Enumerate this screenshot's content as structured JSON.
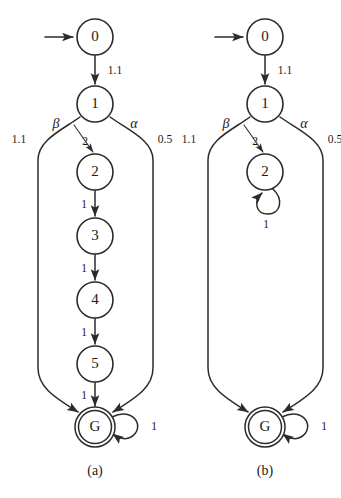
{
  "figure": {
    "background_color": "#ffffff",
    "ink_color": "#2b2b2b"
  },
  "panels": [
    {
      "id": "panel-a",
      "caption": "(a)",
      "start_marker": "start-arrow",
      "nodes": [
        {
          "id": "n0",
          "label": "0",
          "type": "normal",
          "cx": 95,
          "cy": 37,
          "r": 18
        },
        {
          "id": "n1",
          "label": "1",
          "type": "normal",
          "cx": 95,
          "cy": 104,
          "r": 18
        },
        {
          "id": "n2",
          "label": "2",
          "type": "normal",
          "cx": 95,
          "cy": 172,
          "r": 18
        },
        {
          "id": "n3",
          "label": "3",
          "type": "normal",
          "cx": 95,
          "cy": 236,
          "r": 18
        },
        {
          "id": "n4",
          "label": "4",
          "type": "normal",
          "cx": 95,
          "cy": 300,
          "r": 18
        },
        {
          "id": "n5",
          "label": "5",
          "type": "normal",
          "cx": 95,
          "cy": 364,
          "r": 18
        },
        {
          "id": "nG",
          "label": "G",
          "type": "accepting",
          "cx": 95,
          "cy": 427,
          "r": 19
        }
      ],
      "edges": [
        {
          "id": "e-start",
          "from": "start",
          "to": "n0",
          "weight": ""
        },
        {
          "id": "e-0-1",
          "from": "n0",
          "to": "n1",
          "weight": "1.1"
        },
        {
          "id": "e-1-2",
          "from": "n1",
          "to": "n2",
          "weight": "2",
          "action": "β"
        },
        {
          "id": "e-1-G-left",
          "from": "n1",
          "to": "nG",
          "weight": "1.1",
          "action": "β"
        },
        {
          "id": "e-1-G-right",
          "from": "n1",
          "to": "nG",
          "weight": "0.5",
          "action": "α"
        },
        {
          "id": "e-2-3",
          "from": "n2",
          "to": "n3",
          "weight": "1"
        },
        {
          "id": "e-3-4",
          "from": "n3",
          "to": "n4",
          "weight": "1"
        },
        {
          "id": "e-4-5",
          "from": "n4",
          "to": "n5",
          "weight": "1"
        },
        {
          "id": "e-5-G",
          "from": "n5",
          "to": "nG",
          "weight": "1"
        },
        {
          "id": "e-G-G",
          "from": "nG",
          "to": "nG",
          "weight": "1",
          "self_loop": true
        }
      ],
      "action_labels": [
        {
          "id": "a-beta",
          "text": "β",
          "x": 56,
          "y": 125
        },
        {
          "id": "a-alpha",
          "text": "α",
          "x": 133,
          "y": 125
        }
      ],
      "weight_labels": [
        {
          "id": "w-0-1",
          "text": "1.1",
          "x": 113,
          "y": 71
        },
        {
          "id": "w-beta-branch",
          "text": "1.1",
          "x": 20,
          "y": 139
        },
        {
          "id": "w-1-2",
          "text": "2",
          "x": 84,
          "y": 143
        },
        {
          "id": "w-alpha-branch",
          "text": "0.5",
          "x": 162,
          "y": 139
        },
        {
          "id": "w-2-3",
          "text": "1",
          "x": 84,
          "y": 206
        },
        {
          "id": "w-3-4",
          "text": "1",
          "x": 84,
          "y": 270
        },
        {
          "id": "w-4-5",
          "text": "1",
          "x": 84,
          "y": 333
        },
        {
          "id": "w-5-G",
          "text": "1",
          "x": 84,
          "y": 396
        },
        {
          "id": "w-G-self",
          "text": "1",
          "x": 152,
          "y": 427
        }
      ]
    },
    {
      "id": "panel-b",
      "caption": "(b)",
      "start_marker": "start-arrow",
      "nodes": [
        {
          "id": "n0",
          "label": "0",
          "type": "normal",
          "cx": 265,
          "cy": 37,
          "r": 18
        },
        {
          "id": "n1",
          "label": "1",
          "type": "normal",
          "cx": 265,
          "cy": 104,
          "r": 18
        },
        {
          "id": "n2",
          "label": "2",
          "type": "normal",
          "cx": 265,
          "cy": 172,
          "r": 18
        },
        {
          "id": "nG",
          "label": "G",
          "type": "accepting",
          "cx": 265,
          "cy": 427,
          "r": 19
        }
      ],
      "edges": [
        {
          "id": "e-start",
          "from": "start",
          "to": "n0",
          "weight": ""
        },
        {
          "id": "e-0-1",
          "from": "n0",
          "to": "n1",
          "weight": "1.1"
        },
        {
          "id": "e-1-2",
          "from": "n1",
          "to": "n2",
          "weight": "2",
          "action": "β"
        },
        {
          "id": "e-1-G-left",
          "from": "n1",
          "to": "nG",
          "weight": "1.1",
          "action": "β"
        },
        {
          "id": "e-1-G-right",
          "from": "n1",
          "to": "nG",
          "weight": "0.5",
          "action": "α"
        },
        {
          "id": "e-2-2",
          "from": "n2",
          "to": "n2",
          "weight": "1",
          "self_loop": true
        },
        {
          "id": "e-G-G",
          "from": "nG",
          "to": "nG",
          "weight": "1",
          "self_loop": true
        }
      ],
      "action_labels": [
        {
          "id": "a-beta",
          "text": "β",
          "x": 226,
          "y": 125
        },
        {
          "id": "a-alpha",
          "text": "α",
          "x": 303,
          "y": 125
        }
      ],
      "weight_labels": [
        {
          "id": "w-0-1",
          "text": "1.1",
          "x": 283,
          "y": 71
        },
        {
          "id": "w-beta-branch",
          "text": "1.1",
          "x": 190,
          "y": 139
        },
        {
          "id": "w-1-2",
          "text": "2",
          "x": 254,
          "y": 143
        },
        {
          "id": "w-alpha-branch",
          "text": "0.5",
          "x": 332,
          "y": 139
        },
        {
          "id": "w-2-self",
          "text": "1",
          "x": 265,
          "y": 221
        },
        {
          "id": "w-G-self",
          "text": "1",
          "x": 322,
          "y": 427
        }
      ]
    }
  ],
  "captions": [
    {
      "id": "caption-a",
      "text": "(a)",
      "x": 95,
      "y": 471
    },
    {
      "id": "caption-b",
      "text": "(b)",
      "x": 265,
      "y": 471
    }
  ]
}
